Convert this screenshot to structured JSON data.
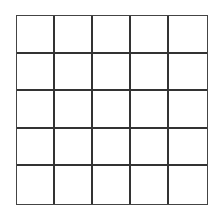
{
  "grid": {
    "rows": 5,
    "cols": 5,
    "line_color": "#333333",
    "background": "#ffffff",
    "cells": [
      [
        "",
        "",
        "",
        "",
        ""
      ],
      [
        "",
        "",
        "",
        "",
        ""
      ],
      [
        "",
        "",
        "",
        "",
        ""
      ],
      [
        "",
        "",
        "",
        "",
        ""
      ],
      [
        "",
        "",
        "",
        "",
        ""
      ]
    ]
  }
}
